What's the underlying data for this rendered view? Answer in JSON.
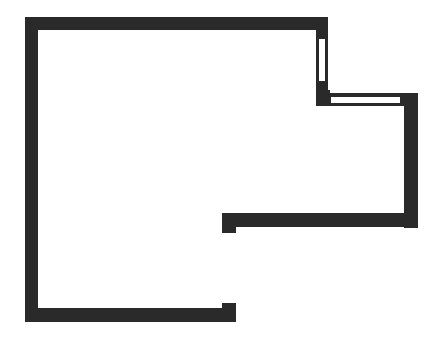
{
  "diagram": {
    "type": "floor-plan",
    "description": "Outline floor plan of an L-shaped room with two windows and a doorway opening on the lower right",
    "colors": {
      "wall": "#2a2a2a",
      "background": "#ffffff",
      "window_fill": "#ffffff"
    },
    "walls": [
      {
        "id": "top-wall",
        "x": 25,
        "y": 17,
        "w": 303,
        "h": 13
      },
      {
        "id": "left-wall",
        "x": 25,
        "y": 17,
        "w": 13,
        "h": 305
      },
      {
        "id": "upper-right-wall",
        "x": 316,
        "y": 17,
        "w": 12,
        "h": 88
      },
      {
        "id": "step-corner-block",
        "x": 316,
        "y": 92,
        "w": 14,
        "h": 14
      },
      {
        "id": "middle-horizontal-wall",
        "x": 316,
        "y": 93,
        "w": 102,
        "h": 13
      },
      {
        "id": "right-wall",
        "x": 404,
        "y": 93,
        "w": 14,
        "h": 135
      },
      {
        "id": "lower-right-wall",
        "x": 222,
        "y": 213,
        "w": 196,
        "h": 14
      },
      {
        "id": "lower-right-wall-end-tab",
        "x": 222,
        "y": 213,
        "w": 14,
        "h": 20
      },
      {
        "id": "bottom-wall",
        "x": 25,
        "y": 308,
        "w": 211,
        "h": 14
      },
      {
        "id": "bottom-wall-end-tab",
        "x": 222,
        "y": 303,
        "w": 14,
        "h": 19
      }
    ],
    "windows": [
      {
        "id": "window-vertical",
        "x": 318,
        "y": 38,
        "w": 8,
        "h": 44
      },
      {
        "id": "window-horizontal",
        "x": 330,
        "y": 96,
        "w": 71,
        "h": 8
      }
    ],
    "opening": {
      "id": "doorway-gap",
      "x": 222,
      "y": 233,
      "w": 14,
      "h": 70
    }
  }
}
